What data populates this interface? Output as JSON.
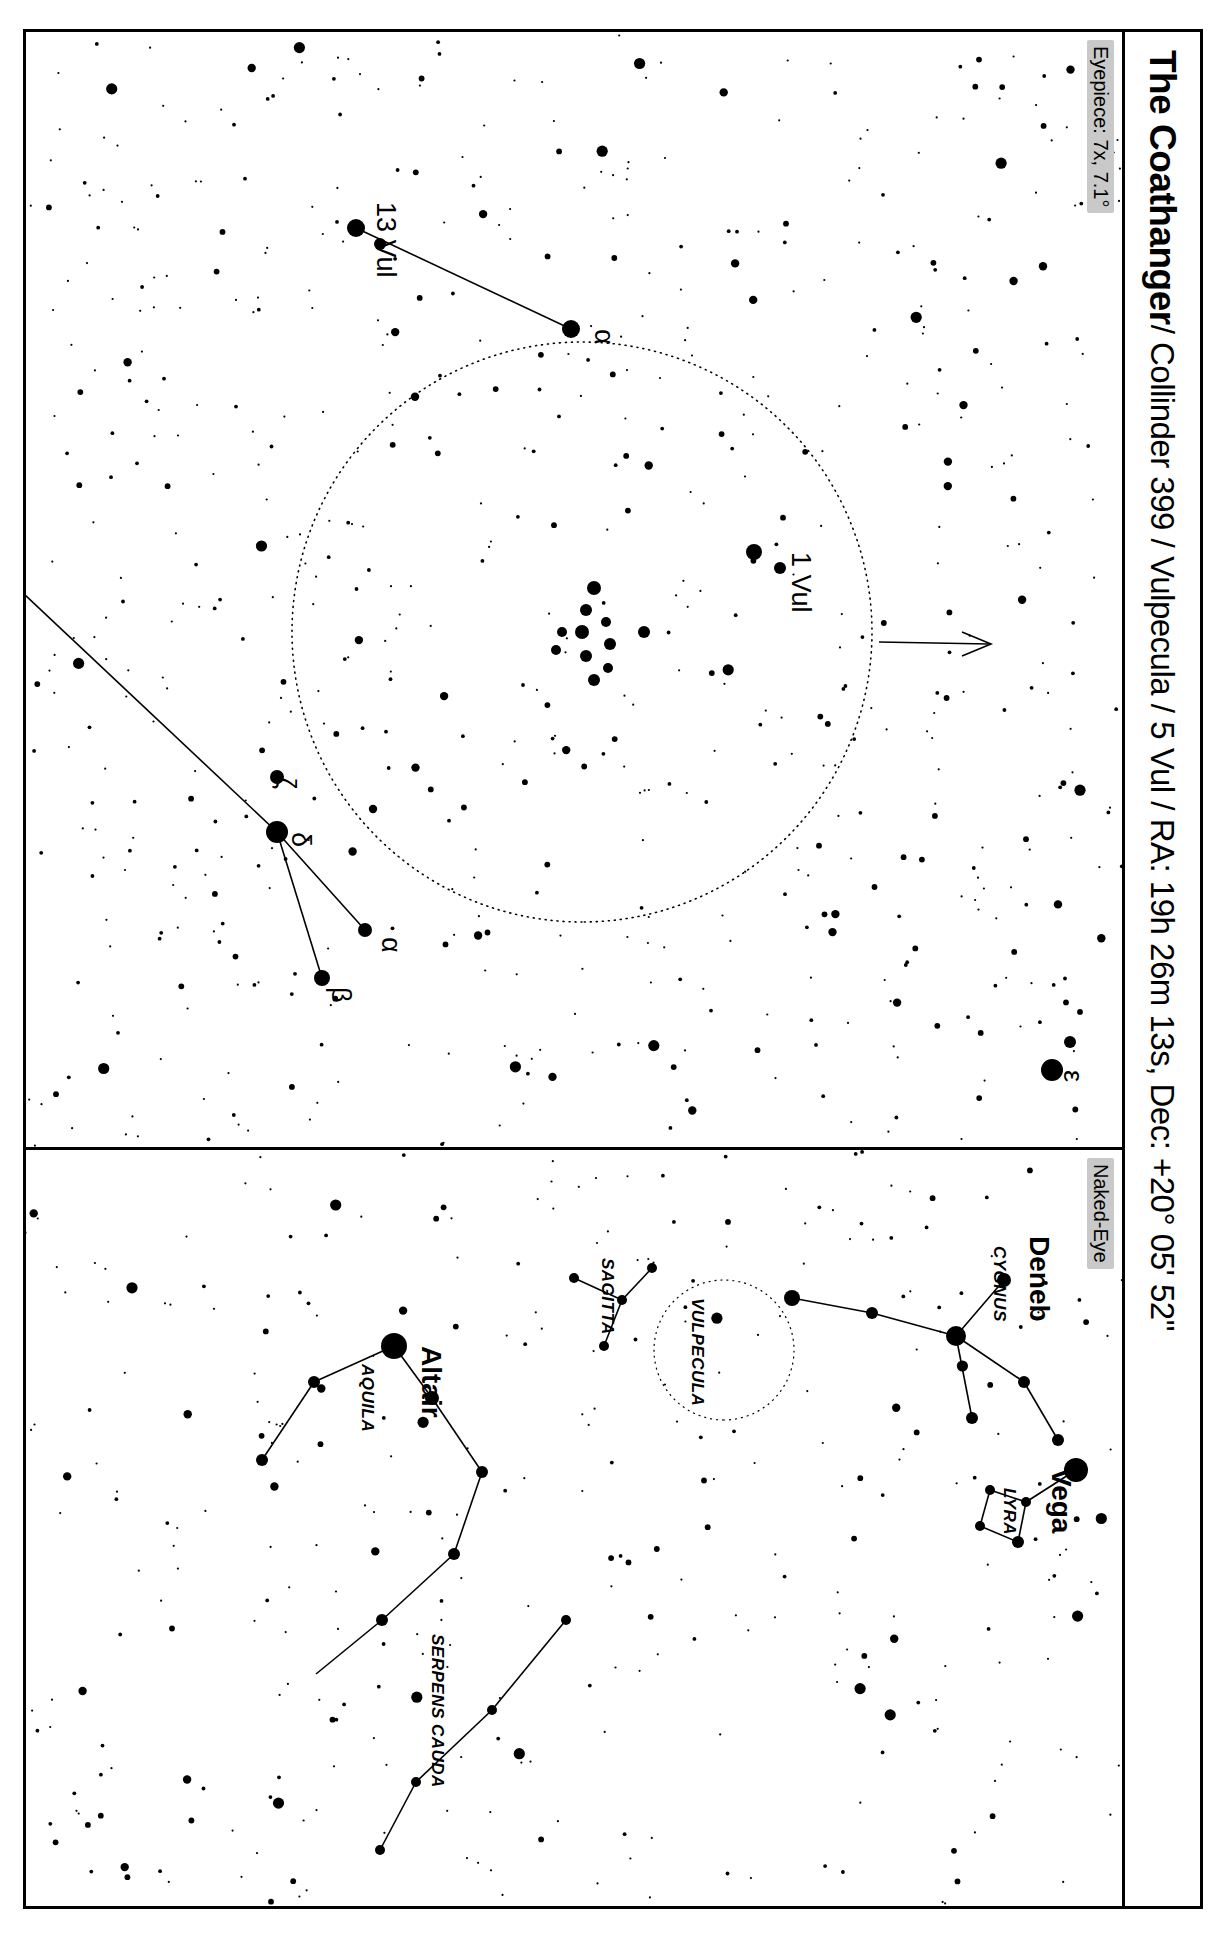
{
  "header": {
    "object_name": "The Coathanger",
    "details": " / Collinder 399 / Vulpecula / 5 Vul / RA: 19h 26m 13s, Dec: +20° 05' 52\""
  },
  "panels": {
    "eyepiece": {
      "tag": "Eyepiece: 7x, 7.1°",
      "labels": [
        {
          "text": "1 Vul",
          "x": 520,
          "y": 330
        },
        {
          "text": "13 Vul",
          "x": 170,
          "y": 745
        },
        {
          "text": "α",
          "x": 297,
          "y": 527
        },
        {
          "text": "α",
          "x": 905,
          "y": 740
        },
        {
          "text": "β",
          "x": 955,
          "y": 790
        },
        {
          "text": "δ",
          "x": 800,
          "y": 830
        },
        {
          "text": "ζ",
          "x": 745,
          "y": 845
        },
        {
          "text": "ε",
          "x": 1038,
          "y": 58
        }
      ]
    },
    "naked_eye": {
      "tag": "Naked-Eye",
      "labels": [
        {
          "text": "Deneb",
          "x": 86,
          "y": 92,
          "kind": "star"
        },
        {
          "text": "Vega",
          "x": 318,
          "y": 70,
          "kind": "star"
        },
        {
          "text": "Altair",
          "x": 196,
          "y": 700,
          "kind": "star"
        },
        {
          "text": "CYGNUS",
          "x": 96,
          "y": 128,
          "kind": "const"
        },
        {
          "text": "LYRA",
          "x": 338,
          "y": 118,
          "kind": "const"
        },
        {
          "text": "AQUILA",
          "x": 214,
          "y": 760,
          "kind": "const"
        },
        {
          "text": "VULPECULA",
          "x": 148,
          "y": 430,
          "kind": "const"
        },
        {
          "text": "SAGITTA",
          "x": 108,
          "y": 520,
          "kind": "const"
        },
        {
          "text": "SERPENS CAUDA",
          "x": 484,
          "y": 690,
          "kind": "const"
        }
      ]
    }
  },
  "colors": {
    "ink": "#000000",
    "tag_background": "#c9c9c9",
    "paper": "#ffffff"
  }
}
